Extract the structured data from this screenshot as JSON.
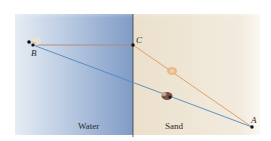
{
  "diagram": {
    "regions": [
      {
        "name": "water",
        "label": "Water",
        "color_light": "#dbe4f0",
        "color_dark": "#8aa3c9"
      },
      {
        "name": "sand",
        "label": "Sand",
        "color": "#efe6d6"
      }
    ],
    "points": {
      "A": {
        "label": "A",
        "x": 252,
        "y": 127
      },
      "B": {
        "label": "B",
        "x": 33,
        "y": 45
      },
      "C": {
        "label": "C",
        "x": 133,
        "y": 45
      }
    },
    "paths": [
      {
        "name": "B-C-A path",
        "via": [
          "B",
          "C",
          "A"
        ],
        "colors": {
          "BC": "#c8a58a",
          "CA": "#e0a070"
        }
      },
      {
        "name": "B-A direct path",
        "via": [
          "B",
          "A"
        ],
        "color": "#5b8fc4"
      }
    ],
    "figures": [
      {
        "name": "lifeguard-on-sand-path",
        "color": "#e8b48a"
      },
      {
        "name": "lifeguard-on-direct-path",
        "color": "#6e4a3a"
      },
      {
        "name": "swimmer-at-B",
        "color": "#d8cdb8"
      }
    ]
  }
}
